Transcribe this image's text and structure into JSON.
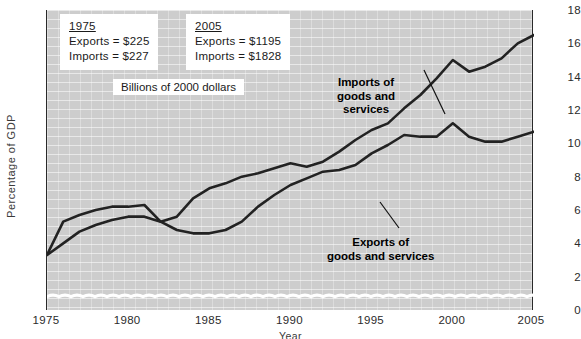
{
  "chart_data": {
    "type": "line",
    "title": "",
    "xlabel": "Year",
    "ylabel": "Percentage of GDP",
    "xlim": [
      1975,
      2005
    ],
    "ylim": [
      0,
      18
    ],
    "yticks": [
      0,
      2,
      4,
      6,
      8,
      10,
      12,
      14,
      16,
      18
    ],
    "xticks": [
      1975,
      1980,
      1985,
      1990,
      1995,
      2000,
      2005
    ],
    "grid": true,
    "legend_position": "inline-annotations",
    "axis_break": "wavy break near zero baseline",
    "x": [
      1975,
      1976,
      1977,
      1978,
      1979,
      1980,
      1981,
      1982,
      1983,
      1984,
      1985,
      1986,
      1987,
      1988,
      1989,
      1990,
      1991,
      1992,
      1993,
      1994,
      1995,
      1996,
      1997,
      1998,
      1999,
      2000,
      2001,
      2002,
      2003,
      2004,
      2005
    ],
    "series": [
      {
        "name": "Imports of goods and services",
        "values": [
          3.3,
          4.0,
          4.7,
          5.1,
          5.4,
          5.6,
          5.6,
          5.3,
          5.6,
          6.7,
          7.3,
          7.6,
          8.0,
          8.2,
          8.5,
          8.8,
          8.6,
          8.9,
          9.5,
          10.2,
          10.8,
          11.2,
          12.1,
          12.9,
          13.9,
          15.0,
          14.3,
          14.6,
          15.1,
          16.0,
          16.5
        ]
      },
      {
        "name": "Exports of goods and services",
        "values": [
          3.3,
          5.3,
          5.7,
          6.0,
          6.2,
          6.2,
          6.3,
          5.3,
          4.8,
          4.6,
          4.6,
          4.8,
          5.3,
          6.2,
          6.9,
          7.5,
          7.9,
          8.3,
          8.4,
          8.7,
          9.4,
          9.9,
          10.5,
          10.4,
          10.4,
          11.2,
          10.4,
          10.1,
          10.1,
          10.4,
          10.7
        ]
      }
    ],
    "annotations": [
      {
        "name": "imports-label",
        "text": "Imports of goods and services"
      },
      {
        "name": "exports-label",
        "text": "Exports of goods and services"
      }
    ]
  },
  "axis": {
    "y_label": "Percentage of GDP",
    "x_label": "Year",
    "y_ticks": [
      "18",
      "16",
      "14",
      "12",
      "10",
      "8",
      "6",
      "4",
      "2",
      "0"
    ],
    "x_ticks": [
      "1975",
      "1980",
      "1985",
      "1990",
      "1995",
      "2000",
      "2005"
    ]
  },
  "boxes": {
    "left": {
      "year": "1975",
      "exports": "Exports = $225",
      "imports": "Imports = $227"
    },
    "right": {
      "year": "2005",
      "exports": "Exports = $1195",
      "imports": "Imports = $1828"
    },
    "units": "Billions of 2000 dollars"
  },
  "notes": {
    "imports_line1": "Imports of",
    "imports_line2": "goods and",
    "imports_line3": "services",
    "exports_line1": "Exports of",
    "exports_line2": "goods and services"
  },
  "colors": {
    "plot_background": "#cdcdcd",
    "line": "#222222",
    "grid": "#ffffff",
    "axis": "#2a2a2a",
    "text": "#1a1a1a"
  }
}
